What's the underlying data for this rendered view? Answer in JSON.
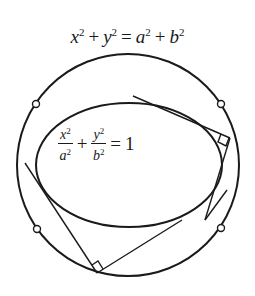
{
  "diagram": {
    "circle_equation": {
      "x": "x",
      "y": "y",
      "a": "a",
      "b": "b",
      "exp": "2",
      "plus": "+",
      "equals": "="
    },
    "ellipse_equation": {
      "x": "x",
      "y": "y",
      "a": "a",
      "b": "b",
      "exp": "2",
      "plus": "+",
      "equals": "=",
      "rhs": "1"
    },
    "colors": {
      "stroke": "#1a1a1a",
      "background": "#ffffff"
    }
  }
}
